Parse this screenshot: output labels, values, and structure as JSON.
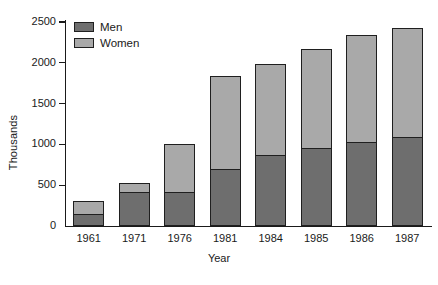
{
  "chart_data": {
    "type": "bar",
    "subtype": "stacked-vertical",
    "title": "",
    "xlabel": "Year",
    "ylabel": "Thousands",
    "categories": [
      "1961",
      "1971",
      "1976",
      "1981",
      "1984",
      "1985",
      "1986",
      "1987"
    ],
    "series": [
      {
        "name": "Men",
        "color": "#6e6e6e",
        "values": [
          150,
          420,
          420,
          700,
          875,
          965,
          1030,
          1090
        ]
      },
      {
        "name": "Women",
        "color": "#a9a9a9",
        "values": [
          155,
          110,
          580,
          1135,
          1105,
          1200,
          1310,
          1335
        ]
      }
    ],
    "totals": [
      305,
      530,
      1000,
      1835,
      1980,
      2165,
      2340,
      2425
    ],
    "ylim": [
      0,
      2500
    ],
    "yticks": [
      0,
      500,
      1000,
      1500,
      2000,
      2500
    ],
    "ytick_labels": [
      "0",
      "500",
      "1000",
      "1500",
      "2000",
      "2500"
    ],
    "grid": false,
    "legend_position": "top-left",
    "legend_entries": [
      "Men",
      "Women"
    ]
  }
}
